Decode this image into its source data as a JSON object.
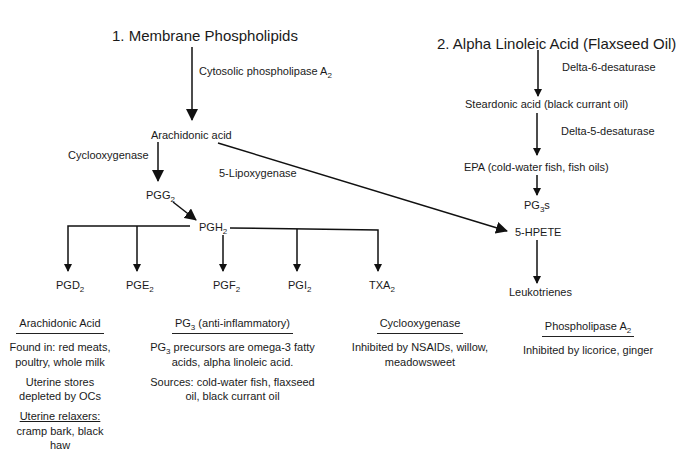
{
  "diagram": {
    "titles": {
      "membrane": "1. Membrane Phospholipids",
      "alpha": "2. Alpha Linoleic Acid (Flaxseed Oil)"
    },
    "enzymes": {
      "cpla2": "Cytosolic phospholipase A",
      "cpla2_sub": "2",
      "cyclooxygenase": "Cyclooxygenase",
      "lipoxygenase": "5-Lipoxygenase",
      "delta6": "Delta-6-desaturase",
      "delta5": "Delta-5-desaturase"
    },
    "nodes": {
      "arachidonic": "Arachidonic acid",
      "pgg": "PGG",
      "pgg_sub": "2",
      "pgh": "PGH",
      "pgh_sub": "2",
      "steardonic": "Steardonic acid (black currant oil)",
      "epa": "EPA (cold-water fish, fish oils)",
      "pg3s_a": "PG",
      "pg3s_sub": "3",
      "pg3s_b": "s",
      "hpete": "5-HPETE",
      "leukotrienes": "Leukotrienes"
    },
    "products": [
      {
        "base": "PGD",
        "sub": "2"
      },
      {
        "base": "PGE",
        "sub": "2"
      },
      {
        "base": "PGF",
        "sub": "2"
      },
      {
        "base": "PGI",
        "sub": "2"
      },
      {
        "base": "TXA",
        "sub": "2"
      }
    ],
    "notes": {
      "arachidonic": {
        "heading": "Arachidonic Acid",
        "found": "Found in: red meats, poultry, whole milk",
        "stores": "Uterine stores depleted by OCs",
        "relaxers_heading": "Uterine relaxers:",
        "relaxers": "cramp bark, black haw"
      },
      "pg3": {
        "heading_a": "PG",
        "heading_sub": "3",
        "heading_b": " (anti-inflammatory)",
        "precursors_a": "PG",
        "precursors_sub": "3",
        "precursors_b": " precursors are omega-3 fatty acids, alpha linoleic acid.",
        "sources": "Sources: cold-water fish, flaxseed oil, black currant oil"
      },
      "cyclooxygenase": {
        "heading": "Cyclooxygenase",
        "text": "Inhibited by NSAIDs, willow, meadowsweet"
      },
      "phospholipase": {
        "heading": "Phospholipase A",
        "heading_sub": "2",
        "text": "Inhibited by licorice, ginger"
      }
    }
  }
}
